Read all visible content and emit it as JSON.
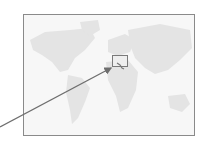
{
  "map": {
    "description": "World map locator",
    "highlight": {
      "region": "Italy",
      "label": ""
    },
    "colors": {
      "frame": "#8a8a8a",
      "land": "#e6e6e6",
      "background": "#f7f7f7",
      "arrow": "#6e6e6e"
    }
  }
}
